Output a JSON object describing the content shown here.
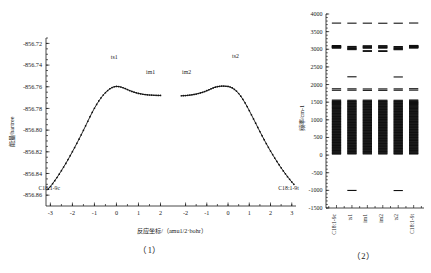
{
  "figure": {
    "panel1_caption": "（1）",
    "panel2_caption": "（2）"
  },
  "panel1": {
    "name": "irc-energy-profile",
    "xlabel": "反应坐标/（amu1/2·bohr）",
    "ylabel": "能量/hartree",
    "segment_labels": {
      "ts1": "ts1",
      "im1": "im1",
      "im2": "im2",
      "ts2": "ts2",
      "reactant": "C18:1-9c",
      "product": "C18:1-9t"
    },
    "yticks": [
      "-856.72",
      "-856.74",
      "-856.76",
      "-856.78",
      "-856.80",
      "-856.82",
      "-856.84",
      "-856.86"
    ],
    "xticks_left": [
      "-3",
      "-2",
      "-1",
      "0",
      "1",
      "2"
    ],
    "xticks_right": [
      "-2",
      "-1",
      "0",
      "1",
      "2",
      "3"
    ]
  },
  "panel2": {
    "name": "vibrational-frequency-spectrum",
    "ylabel": "频率/cm-1",
    "yticks": [
      "4000",
      "3500",
      "3000",
      "2500",
      "2000",
      "1500",
      "1000",
      "500",
      "0",
      "-500",
      "-1000",
      "-1500"
    ],
    "categories": [
      "C18:1-9c",
      "ts1",
      "im1",
      "im2",
      "ts2",
      "C18:1-9t"
    ]
  },
  "chart_data": [
    {
      "type": "line",
      "title": "IRC reaction energy profile",
      "xlabel": "反应坐标/（amu1/2·bohr）",
      "ylabel": "能量/hartree",
      "xlim": [
        -3.2,
        3.2
      ],
      "ylim": [
        -856.87,
        -856.715
      ],
      "grid": false,
      "legend": "none",
      "annotations": [
        {
          "text": "C18:1-9c",
          "x": -3.05,
          "y": -856.855
        },
        {
          "text": "ts1",
          "x": -0.1,
          "y": -856.734
        },
        {
          "text": "im1",
          "x": 1.55,
          "y": -856.748
        },
        {
          "text": "im2",
          "x": -1.95,
          "y": -856.748
        },
        {
          "text": "ts2",
          "x": 0.35,
          "y": -856.733
        },
        {
          "text": "C18:1-9t",
          "x": 2.85,
          "y": -856.855
        }
      ],
      "series": [
        {
          "name": "branch-1",
          "x": [
            -3.1,
            -3.0,
            -2.9,
            -2.8,
            -2.7,
            -2.6,
            -2.5,
            -2.4,
            -2.3,
            -2.2,
            -2.1,
            -2.0,
            -1.9,
            -1.8,
            -1.7,
            -1.6,
            -1.5,
            -1.4,
            -1.3,
            -1.2,
            -1.1,
            -1.0,
            -0.9,
            -0.8,
            -0.7,
            -0.6,
            -0.5,
            -0.4,
            -0.3,
            -0.2,
            -0.1,
            0.0,
            0.1,
            0.2,
            0.3,
            0.4,
            0.5,
            0.6,
            0.7,
            0.8,
            0.9,
            1.0,
            1.1,
            1.2,
            1.3,
            1.4,
            1.5,
            1.6,
            1.7,
            1.8,
            1.9,
            2.0
          ],
          "y": [
            -856.8545,
            -856.852,
            -856.8494,
            -856.8466,
            -856.8437,
            -856.8406,
            -856.8374,
            -856.8341,
            -856.8307,
            -856.8272,
            -856.8236,
            -856.8199,
            -856.8161,
            -856.8122,
            -856.8083,
            -856.8043,
            -856.8002,
            -856.796,
            -856.7918,
            -856.7876,
            -856.7836,
            -856.7798,
            -856.7763,
            -856.7731,
            -856.7702,
            -856.7676,
            -856.7654,
            -856.7635,
            -856.7619,
            -856.7607,
            -856.76,
            -856.7597,
            -856.7598,
            -856.7602,
            -856.7609,
            -856.7617,
            -856.7626,
            -856.7635,
            -856.7643,
            -856.765,
            -856.7656,
            -856.7661,
            -856.7665,
            -856.7669,
            -856.7672,
            -856.7674,
            -856.7676,
            -856.7677,
            -856.7678,
            -856.7679,
            -856.768,
            -856.768
          ]
        },
        {
          "name": "branch-2",
          "x": [
            -2.2,
            -2.1,
            -2.0,
            -1.9,
            -1.8,
            -1.7,
            -1.6,
            -1.5,
            -1.4,
            -1.3,
            -1.2,
            -1.1,
            -1.0,
            -0.9,
            -0.8,
            -0.7,
            -0.6,
            -0.5,
            -0.4,
            -0.3,
            -0.2,
            -0.1,
            0.0,
            0.1,
            0.2,
            0.3,
            0.4,
            0.5,
            0.6,
            0.7,
            0.8,
            0.9,
            1.0,
            1.1,
            1.2,
            1.3,
            1.4,
            1.5,
            1.6,
            1.7,
            1.8,
            1.9,
            2.0,
            2.1,
            2.2,
            2.3,
            2.4,
            2.5,
            2.6,
            2.7,
            2.8,
            2.9,
            3.0,
            3.1
          ],
          "y": [
            -856.7683,
            -856.7682,
            -856.7681,
            -856.7679,
            -856.7677,
            -856.7674,
            -856.7671,
            -856.7667,
            -856.7662,
            -856.7657,
            -856.7651,
            -856.7644,
            -856.7636,
            -856.7628,
            -856.7619,
            -856.7611,
            -856.7604,
            -856.7599,
            -856.7596,
            -856.7594,
            -856.7594,
            -856.7595,
            -856.7597,
            -856.7602,
            -856.7611,
            -856.7624,
            -856.7641,
            -856.7662,
            -856.7687,
            -856.7716,
            -856.7748,
            -856.7783,
            -856.782,
            -856.7858,
            -856.7897,
            -856.7936,
            -856.7975,
            -856.8013,
            -856.8051,
            -856.8088,
            -856.8124,
            -856.8159,
            -856.8193,
            -856.8226,
            -856.8258,
            -856.8289,
            -856.8319,
            -856.8348,
            -856.8376,
            -856.8403,
            -856.8429,
            -856.8454,
            -856.8478,
            -856.85
          ]
        }
      ]
    },
    {
      "type": "scatter",
      "title": "Harmonic vibrational frequencies of stationary points",
      "xlabel": "",
      "ylabel": "频率/cm-1",
      "categories": [
        "C18:1-9c",
        "ts1",
        "im1",
        "im2",
        "ts2",
        "C18:1-9t"
      ],
      "ylim": [
        -1500,
        4000
      ],
      "ytick_step": 500,
      "grid": false,
      "legend": "none",
      "marker": "horizontal-dash",
      "series": [
        {
          "name": "C18:1-9c",
          "values": [
            3742,
            3105,
            3098,
            3090,
            3082,
            3074,
            3066,
            3058,
            3050,
            3042,
            3034,
            1880,
            1838,
            1560,
            1540,
            1520,
            1505,
            1490,
            1478,
            1462,
            1448,
            1432,
            1418,
            1400,
            1385,
            1368,
            1352,
            1338,
            1320,
            1300,
            1285,
            1268,
            1250,
            1232,
            1215,
            1198,
            1180,
            1162,
            1145,
            1128,
            1110,
            1092,
            1075,
            1058,
            1040,
            1022,
            1005,
            988,
            970,
            952,
            935,
            918,
            900,
            882,
            865,
            848,
            830,
            812,
            795,
            778,
            760,
            742,
            725,
            708,
            690,
            672,
            655,
            638,
            620,
            602,
            585,
            568,
            550,
            532,
            515,
            498,
            480,
            462,
            445,
            428,
            410,
            392,
            375,
            358,
            340,
            322,
            305,
            288,
            270,
            252,
            235,
            218,
            200,
            182,
            165,
            148,
            130,
            112,
            95,
            78,
            60,
            42,
            30
          ]
        },
        {
          "name": "ts1",
          "values": [
            3740,
            3080,
            3058,
            3040,
            3022,
            3005,
            2990,
            2220,
            1878,
            1840,
            1555,
            1535,
            1518,
            1500,
            1482,
            1465,
            1448,
            1430,
            1412,
            1395,
            1378,
            1360,
            1342,
            1325,
            1308,
            1290,
            1272,
            1255,
            1238,
            1220,
            1202,
            1185,
            1168,
            1150,
            1132,
            1115,
            1098,
            1080,
            1062,
            1045,
            1028,
            1010,
            992,
            975,
            958,
            940,
            922,
            905,
            888,
            870,
            852,
            835,
            818,
            800,
            782,
            765,
            748,
            730,
            712,
            695,
            678,
            660,
            642,
            625,
            608,
            590,
            572,
            555,
            538,
            520,
            502,
            485,
            468,
            450,
            432,
            415,
            398,
            380,
            362,
            345,
            328,
            310,
            292,
            275,
            258,
            240,
            222,
            205,
            188,
            170,
            152,
            135,
            118,
            100,
            82,
            65,
            48,
            32,
            -1002
          ]
        },
        {
          "name": "im1",
          "values": [
            3740,
            3100,
            3082,
            3065,
            3048,
            3030,
            2960,
            2940,
            1875,
            1835,
            1558,
            1538,
            1520,
            1502,
            1485,
            1468,
            1450,
            1432,
            1415,
            1398,
            1380,
            1362,
            1345,
            1328,
            1310,
            1292,
            1275,
            1258,
            1240,
            1222,
            1205,
            1188,
            1170,
            1152,
            1135,
            1118,
            1100,
            1082,
            1065,
            1048,
            1030,
            1012,
            995,
            978,
            960,
            942,
            925,
            908,
            890,
            872,
            855,
            838,
            820,
            802,
            785,
            768,
            750,
            732,
            715,
            698,
            680,
            662,
            645,
            628,
            610,
            592,
            575,
            558,
            540,
            522,
            505,
            488,
            470,
            452,
            435,
            418,
            400,
            382,
            365,
            348,
            330,
            312,
            295,
            278,
            260,
            242,
            225,
            208,
            190,
            172,
            155,
            138,
            120,
            102,
            85,
            68,
            50,
            32
          ]
        },
        {
          "name": "im2",
          "values": [
            3738,
            3102,
            3085,
            3068,
            3050,
            3032,
            2958,
            2938,
            1876,
            1836,
            1556,
            1536,
            1519,
            1501,
            1484,
            1466,
            1449,
            1431,
            1414,
            1396,
            1379,
            1361,
            1344,
            1326,
            1309,
            1291,
            1274,
            1256,
            1239,
            1221,
            1204,
            1186,
            1169,
            1151,
            1134,
            1116,
            1099,
            1081,
            1064,
            1046,
            1029,
            1011,
            994,
            976,
            959,
            941,
            924,
            906,
            889,
            871,
            854,
            836,
            819,
            801,
            784,
            766,
            749,
            731,
            714,
            696,
            679,
            661,
            644,
            626,
            609,
            591,
            574,
            556,
            539,
            521,
            504,
            486,
            469,
            451,
            434,
            416,
            399,
            381,
            364,
            346,
            329,
            311,
            294,
            276,
            259,
            241,
            224,
            206,
            189,
            171,
            154,
            136,
            119,
            101,
            84,
            66,
            49,
            31
          ]
        },
        {
          "name": "ts2",
          "values": [
            3739,
            3078,
            3056,
            3038,
            3020,
            3002,
            2988,
            2215,
            1877,
            1839,
            1554,
            1534,
            1517,
            1499,
            1481,
            1464,
            1446,
            1429,
            1411,
            1394,
            1376,
            1359,
            1341,
            1324,
            1306,
            1289,
            1271,
            1254,
            1236,
            1219,
            1201,
            1184,
            1166,
            1149,
            1131,
            1114,
            1096,
            1079,
            1061,
            1044,
            1026,
            1009,
            991,
            974,
            956,
            939,
            921,
            904,
            886,
            869,
            851,
            834,
            816,
            799,
            781,
            764,
            746,
            729,
            711,
            694,
            676,
            659,
            641,
            624,
            606,
            589,
            571,
            554,
            536,
            519,
            501,
            484,
            466,
            449,
            431,
            414,
            396,
            379,
            361,
            344,
            326,
            309,
            291,
            274,
            256,
            239,
            221,
            204,
            186,
            169,
            151,
            134,
            116,
            99,
            81,
            64,
            46,
            29,
            -1005
          ]
        },
        {
          "name": "C18:1-9t",
          "values": [
            3744,
            3108,
            3100,
            3092,
            3084,
            3076,
            3068,
            3060,
            3052,
            3044,
            3036,
            1882,
            1842,
            1562,
            1542,
            1522,
            1506,
            1492,
            1480,
            1464,
            1450,
            1434,
            1420,
            1402,
            1386,
            1370,
            1354,
            1340,
            1322,
            1302,
            1286,
            1270,
            1252,
            1234,
            1216,
            1200,
            1182,
            1164,
            1146,
            1130,
            1112,
            1094,
            1076,
            1060,
            1042,
            1024,
            1006,
            990,
            972,
            954,
            936,
            920,
            902,
            884,
            866,
            850,
            832,
            814,
            796,
            780,
            762,
            744,
            726,
            710,
            692,
            674,
            656,
            640,
            622,
            604,
            586,
            570,
            552,
            534,
            516,
            500,
            482,
            464,
            446,
            430,
            412,
            394,
            376,
            360,
            342,
            324,
            306,
            290,
            272,
            254,
            236,
            220,
            202,
            184,
            166,
            150,
            132,
            114,
            96,
            80,
            62,
            44,
            32
          ]
        }
      ]
    }
  ]
}
